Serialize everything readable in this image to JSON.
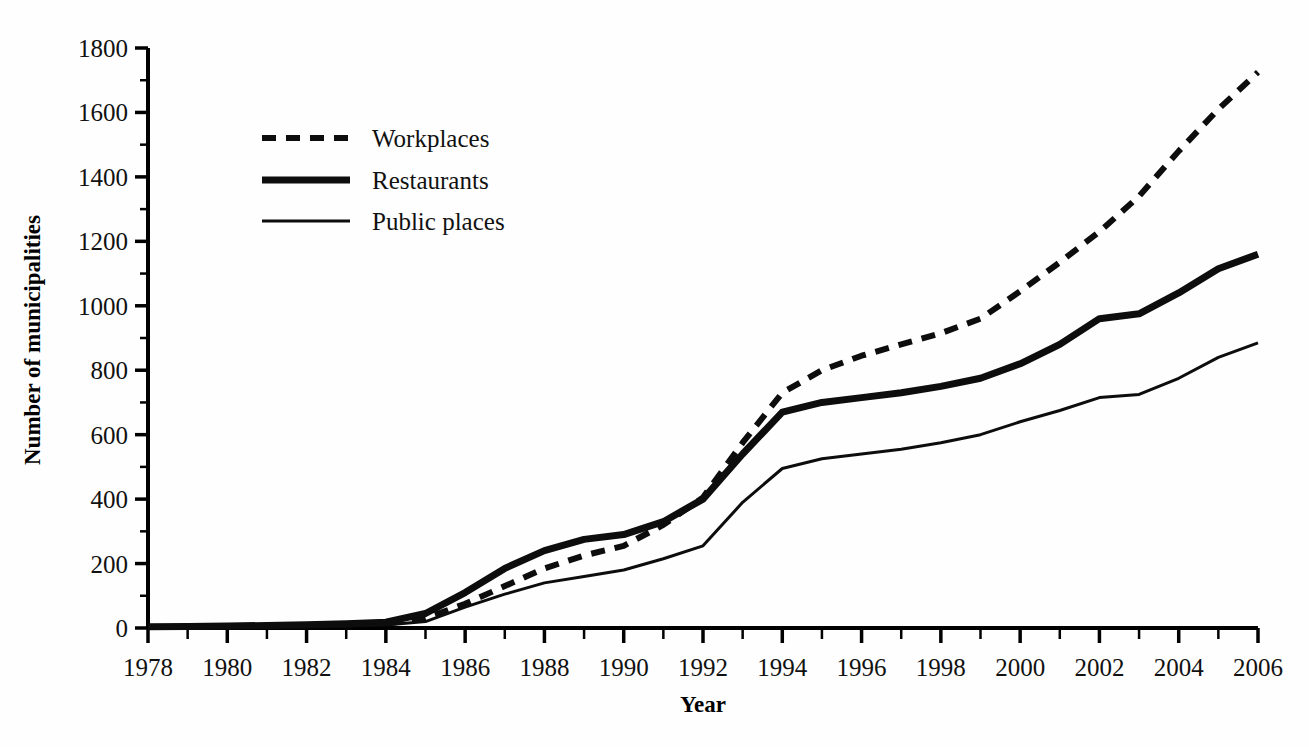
{
  "chart_data": {
    "type": "line",
    "title": "",
    "xlabel": "Year",
    "ylabel": "Number of municipalities",
    "xlim": [
      1978,
      2006
    ],
    "ylim": [
      0,
      1800
    ],
    "ytick_step": 200,
    "yminor_step": 100,
    "xtick_step": 1,
    "xlabel_step": 2,
    "grid": false,
    "legend_position": "upper-left-inside",
    "x": [
      1978,
      1979,
      1980,
      1981,
      1982,
      1983,
      1984,
      1985,
      1986,
      1987,
      1988,
      1989,
      1990,
      1991,
      1992,
      1993,
      1994,
      1995,
      1996,
      1997,
      1998,
      1999,
      2000,
      2001,
      2002,
      2003,
      2004,
      2005,
      2006
    ],
    "ytick_labels": [
      "0",
      "200",
      "400",
      "600",
      "800",
      "1000",
      "1200",
      "1400",
      "1600",
      "1800"
    ],
    "xtick_labels": [
      "1978",
      "1980",
      "1982",
      "1984",
      "1986",
      "1988",
      "1990",
      "1992",
      "1994",
      "1996",
      "1998",
      "2000",
      "2002",
      "2004",
      "2006"
    ],
    "series": [
      {
        "name": "Workplaces",
        "style": "dashed",
        "stroke_width": 6,
        "dash": "14,10",
        "values": [
          3,
          4,
          5,
          6,
          8,
          10,
          14,
          30,
          75,
          130,
          185,
          225,
          255,
          320,
          405,
          575,
          730,
          800,
          845,
          880,
          915,
          960,
          1045,
          1135,
          1230,
          1340,
          1480,
          1610,
          1725
        ]
      },
      {
        "name": "Restaurants",
        "style": "solid",
        "stroke_width": 7,
        "dash": "",
        "values": [
          4,
          5,
          6,
          8,
          10,
          13,
          18,
          45,
          110,
          185,
          240,
          275,
          290,
          330,
          400,
          540,
          670,
          700,
          715,
          730,
          750,
          775,
          820,
          880,
          960,
          975,
          1040,
          1115,
          1160
        ]
      },
      {
        "name": "Public places",
        "style": "solid",
        "stroke_width": 3,
        "dash": "",
        "values": [
          2,
          3,
          4,
          5,
          6,
          7,
          9,
          20,
          65,
          105,
          140,
          160,
          180,
          215,
          255,
          390,
          495,
          525,
          540,
          555,
          575,
          600,
          640,
          675,
          715,
          725,
          775,
          840,
          885
        ]
      }
    ]
  },
  "legend": {
    "items": [
      {
        "label": "Workplaces"
      },
      {
        "label": "Restaurants"
      },
      {
        "label": "Public places"
      }
    ]
  },
  "colors": {
    "ink": "#0d0d0d",
    "background": "#fefefe"
  }
}
